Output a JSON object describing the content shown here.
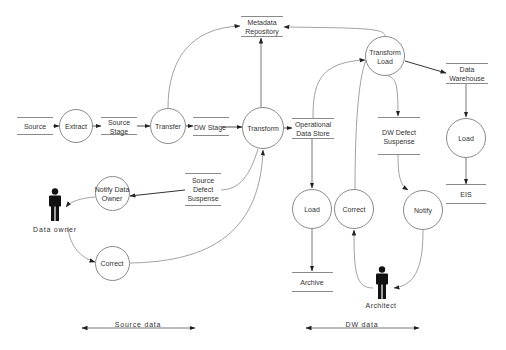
{
  "diagram": {
    "type": "data-flow-diagram",
    "processes": [
      {
        "id": "extract",
        "label": "Extract",
        "cx": 76,
        "cy": 126,
        "r": 17
      },
      {
        "id": "transfer",
        "label": "Transfer",
        "cx": 168,
        "cy": 126,
        "r": 18
      },
      {
        "id": "transform",
        "label": "Transform",
        "cx": 263,
        "cy": 128,
        "r": 21
      },
      {
        "id": "transform-load",
        "label": "Transform\nLoad",
        "cx": 385,
        "cy": 56,
        "r": 20
      },
      {
        "id": "notify-data-owner",
        "label": "Notify Data\nOwner",
        "cx": 112,
        "cy": 193,
        "r": 17
      },
      {
        "id": "correct-source",
        "label": "Correct",
        "cx": 112,
        "cy": 263,
        "r": 17
      },
      {
        "id": "load-ods",
        "label": "Load",
        "cx": 312,
        "cy": 209,
        "r": 20
      },
      {
        "id": "correct-dw",
        "label": "Correct",
        "cx": 354,
        "cy": 209,
        "r": 20
      },
      {
        "id": "notify",
        "label": "Notify",
        "cx": 423,
        "cy": 210,
        "r": 20
      },
      {
        "id": "load-dw",
        "label": "Load",
        "cx": 466,
        "cy": 138,
        "r": 20
      }
    ],
    "stores": [
      {
        "id": "source",
        "label": "Source",
        "x": 17,
        "y": 117,
        "w": 36,
        "h": 18
      },
      {
        "id": "source-stage",
        "label": "Source\nStage",
        "x": 101,
        "y": 117,
        "w": 36,
        "h": 18
      },
      {
        "id": "dw-stage",
        "label": "DW Stage",
        "x": 193,
        "y": 117,
        "w": 36,
        "h": 19
      },
      {
        "id": "operational-data-store",
        "label": "Operational\nData Store",
        "x": 292,
        "y": 118,
        "w": 42,
        "h": 21
      },
      {
        "id": "metadata-repository",
        "label": "Metadata\nRepository",
        "x": 241,
        "y": 16,
        "w": 42,
        "h": 21
      },
      {
        "id": "data-warehouse",
        "label": "Data\nWarehouse",
        "x": 446,
        "y": 63,
        "w": 42,
        "h": 21
      },
      {
        "id": "dw-defect-suspense",
        "label": "DW Defect\nSuspense",
        "x": 378,
        "y": 117,
        "w": 42,
        "h": 38
      },
      {
        "id": "eis",
        "label": "EIS",
        "x": 446,
        "y": 184,
        "w": 40,
        "h": 20
      },
      {
        "id": "source-defect-suspense",
        "label": "Source\nDefect\nSuspense",
        "x": 185,
        "y": 173,
        "w": 36,
        "h": 33
      },
      {
        "id": "archive",
        "label": "Archive",
        "x": 292,
        "y": 272,
        "w": 41,
        "h": 20
      }
    ],
    "actors": [
      {
        "id": "data-owner",
        "label": "Data owner",
        "x": 55,
        "y": 200
      },
      {
        "id": "architect",
        "label": "Architect",
        "x": 382,
        "y": 278
      }
    ],
    "ranges": [
      {
        "id": "source-data",
        "label": "Source data",
        "x1": 80,
        "x2": 196,
        "y": 329
      },
      {
        "id": "dw-data",
        "label": "DW data",
        "x1": 305,
        "x2": 420,
        "y": 329
      }
    ]
  },
  "labels": {
    "source": "Source",
    "extract": "Extract",
    "source_stage_1": "Source",
    "source_stage_2": "Stage",
    "transfer": "Transfer",
    "dw_stage": "DW Stage",
    "transform": "Transform",
    "ods_1": "Operational",
    "ods_2": "Data Store",
    "metadata_1": "Metadata",
    "metadata_2": "Repository",
    "transform_load_1": "Transform",
    "transform_load_2": "Load",
    "dw_1": "Data",
    "dw_2": "Warehouse",
    "dw_defect_1": "DW Defect",
    "dw_defect_2": "Suspense",
    "load_dw": "Load",
    "eis": "EIS",
    "source_defect_1": "Source",
    "source_defect_2": "Defect",
    "source_defect_3": "Suspense",
    "notify_owner_1": "Notify Data",
    "notify_owner_2": "Owner",
    "data_owner": "Data owner",
    "correct_source": "Correct",
    "load_ods": "Load",
    "correct_dw": "Correct",
    "notify": "Notify",
    "archive": "Archive",
    "architect": "Architect",
    "source_data": "Source data",
    "dw_data": "DW data"
  },
  "colors": {
    "line": "#8a8a8a",
    "arrow": "#222222",
    "text": "#333333",
    "actor": "#111111"
  }
}
